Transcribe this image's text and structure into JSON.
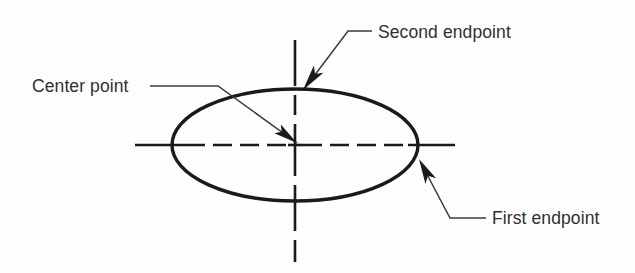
{
  "figure": {
    "background_color": "#fefefe",
    "ink_color": "#1a1a1a",
    "text_color": "#2f2f33",
    "leader_color": "#3a3a3a"
  },
  "shape": {
    "name": "ellipse",
    "center_x": 295,
    "center_y": 145,
    "radius_x": 123,
    "radius_y": 56,
    "stroke_width": 3.4
  },
  "centerlines": {
    "style": "dash-dot center line",
    "horizontal": {
      "x_start": 135,
      "x_end": 455,
      "y": 145
    },
    "vertical": {
      "y_start": 40,
      "y_end": 262,
      "x": 295
    },
    "center_mark": "center-cross-tick"
  },
  "callouts": [
    {
      "id": "center-point",
      "label": "Center point",
      "text_x": 32,
      "text_y": 92,
      "leader_points": "150,86 218,86 297,143",
      "arrow_tip_x": 297,
      "arrow_tip_y": 143,
      "arrow_angle": 36
    },
    {
      "id": "second-endpoint",
      "label": "Second endpoint",
      "text_x": 378,
      "text_y": 38,
      "leader_points": "372,31 348,31 305,88",
      "arrow_tip_x": 303,
      "arrow_tip_y": 90,
      "arrow_angle": 127
    },
    {
      "id": "first-endpoint",
      "label": "First endpoint",
      "text_x": 492,
      "text_y": 224,
      "leader_points": "486,218 450,218 421,163",
      "arrow_tip_x": 419,
      "arrow_tip_y": 159,
      "arrow_angle": 242
    }
  ]
}
